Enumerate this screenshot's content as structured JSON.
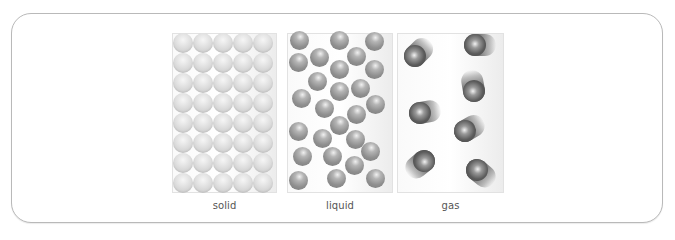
{
  "diagram": {
    "panels": [
      {
        "id": "solid",
        "label": "solid",
        "particle_color": "#d8d8d8",
        "arrangement": "regular grid 5 columns x 8 rows"
      },
      {
        "id": "liquid",
        "label": "liquid",
        "particle_color": "#8f8f8f",
        "arrangement": "irregular, close together"
      },
      {
        "id": "gas",
        "label": "gas",
        "particle_color": "#555555",
        "arrangement": "far apart, moving (motion trails)"
      }
    ],
    "solid": {
      "columns": [
        183,
        203,
        223,
        243,
        263
      ],
      "rows": [
        43,
        63,
        83,
        103,
        123,
        143,
        163,
        183
      ]
    },
    "liquid": {
      "particles": [
        [
          299,
          40
        ],
        [
          339,
          40
        ],
        [
          374,
          41
        ],
        [
          298,
          62
        ],
        [
          319,
          57
        ],
        [
          356,
          56
        ],
        [
          339,
          69
        ],
        [
          374,
          69
        ],
        [
          317,
          81
        ],
        [
          360,
          88
        ],
        [
          339,
          91
        ],
        [
          301,
          98
        ],
        [
          375,
          104
        ],
        [
          324,
          108
        ],
        [
          356,
          114
        ],
        [
          339,
          125
        ],
        [
          298,
          131
        ],
        [
          322,
          138
        ],
        [
          355,
          139
        ],
        [
          370,
          151
        ],
        [
          302,
          156
        ],
        [
          332,
          156
        ],
        [
          354,
          165
        ],
        [
          298,
          180
        ],
        [
          336,
          178
        ],
        [
          375,
          178
        ]
      ]
    },
    "gas": {
      "particles": [
        {
          "x": 415,
          "y": 56,
          "angle": -45
        },
        {
          "x": 475,
          "y": 45,
          "angle": 0
        },
        {
          "x": 474,
          "y": 91,
          "angle": -100
        },
        {
          "x": 420,
          "y": 113,
          "angle": -10
        },
        {
          "x": 465,
          "y": 131,
          "angle": -30
        },
        {
          "x": 424,
          "y": 161,
          "angle": 140
        },
        {
          "x": 477,
          "y": 170,
          "angle": 40
        }
      ]
    }
  }
}
